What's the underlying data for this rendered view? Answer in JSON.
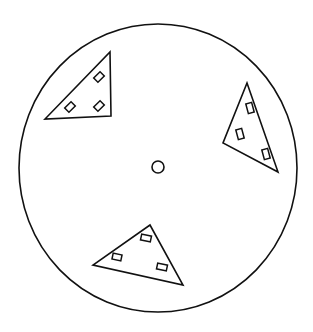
{
  "diagram": {
    "type": "rotor-disc-with-triangular-plates",
    "canvas": {
      "width": 313,
      "height": 332,
      "background": "#ffffff"
    },
    "stroke_color": "#111111",
    "outer_circle": {
      "cx": 158,
      "cy": 168,
      "rx": 139,
      "ry": 144
    },
    "center_hole": {
      "cx": 158,
      "cy": 167,
      "r": 6
    },
    "triangles": [
      {
        "name": "top-left",
        "points": [
          [
            110,
            52
          ],
          [
            111,
            116
          ],
          [
            45,
            119
          ]
        ],
        "slots": [
          {
            "cx": 99,
            "cy": 77,
            "w": 6,
            "h": 9,
            "angle": 45
          },
          {
            "cx": 70,
            "cy": 107,
            "w": 6,
            "h": 9,
            "angle": 45
          },
          {
            "cx": 99,
            "cy": 106,
            "w": 6,
            "h": 9,
            "angle": 45
          }
        ]
      },
      {
        "name": "right",
        "points": [
          [
            247,
            83
          ],
          [
            278,
            172
          ],
          [
            223,
            143
          ]
        ],
        "slots": [
          {
            "cx": 250,
            "cy": 108,
            "w": 6,
            "h": 10,
            "angle": -15
          },
          {
            "cx": 240,
            "cy": 134,
            "w": 6,
            "h": 10,
            "angle": -15
          },
          {
            "cx": 266,
            "cy": 154,
            "w": 6,
            "h": 10,
            "angle": -15
          }
        ]
      },
      {
        "name": "bottom",
        "points": [
          [
            150,
            225
          ],
          [
            183,
            285
          ],
          [
            93,
            265
          ]
        ],
        "slots": [
          {
            "cx": 146,
            "cy": 238,
            "w": 10,
            "h": 6,
            "angle": 12
          },
          {
            "cx": 117,
            "cy": 257,
            "w": 9,
            "h": 6,
            "angle": 12
          },
          {
            "cx": 162,
            "cy": 267,
            "w": 10,
            "h": 6,
            "angle": 12
          }
        ]
      }
    ]
  }
}
